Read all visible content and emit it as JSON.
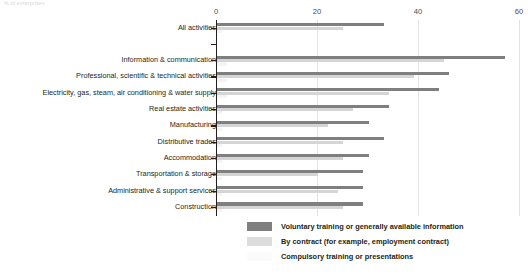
{
  "unit_note": "% of enterprises",
  "chart_data": {
    "type": "bar",
    "orientation": "horizontal",
    "title": "",
    "subtitle": "",
    "xlabel": "",
    "ylabel": "",
    "unit_note": "% of enterprises",
    "xlim": [
      0,
      60
    ],
    "xticks": [
      0,
      20,
      40,
      60
    ],
    "xtick_labels": [
      "0",
      "20",
      "40",
      "60"
    ],
    "grid": true,
    "legend_position": "bottom-right",
    "categories": [
      "All activities",
      "",
      "Information & communication",
      "Professional, scientific & technical activities",
      "Electricity, gas, steam, air conditioning & water supply",
      "Real estate activities",
      "Manufacturing",
      "Distributive trades",
      "Accommodation",
      "Transportation & storage",
      "Administrative & support services",
      "Construction"
    ],
    "series": [
      {
        "name": "Voluntary training or generally available information",
        "color": "#7f7f7f",
        "values": [
          33,
          null,
          57,
          46,
          44,
          34,
          30,
          33,
          30,
          29,
          29,
          29
        ]
      },
      {
        "name": "By contract (for example, employment contract)",
        "color": "#d5d5d5",
        "values": [
          25,
          null,
          45,
          39,
          34,
          27,
          22,
          25,
          25,
          20,
          24,
          25
        ]
      },
      {
        "name": "Compulsory training or presentations",
        "color": "#f4f4f4",
        "values": [
          1,
          null,
          2,
          2,
          2,
          1,
          1,
          1,
          1,
          1,
          1,
          1
        ]
      }
    ]
  },
  "legend": {
    "items": [
      "Voluntary training or generally available information",
      "By contract (for example, employment contract)",
      "Compulsory training or presentations"
    ]
  }
}
